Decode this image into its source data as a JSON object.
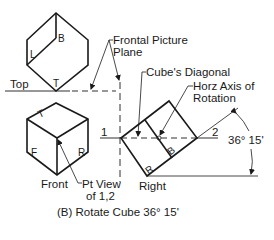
{
  "diagram": {
    "caption": "(B) Rotate Cube 36° 15'",
    "views": {
      "top": {
        "label": "Top",
        "faces": [
          "B",
          "L",
          "T"
        ]
      },
      "front": {
        "label": "Front",
        "faces": [
          "T",
          "F",
          "R"
        ]
      },
      "right": {
        "label": "Right",
        "faces": [
          "R",
          "B"
        ]
      }
    },
    "callouts": {
      "frontal_picture_plane_line1": "Frontal Picture",
      "frontal_picture_plane_line2": "Plane",
      "cubes_diagonal": "Cube's Diagonal",
      "horz_axis_line1": "Horz Axis of",
      "horz_axis_line2": "Rotation",
      "pt_view_line1": "Pt View",
      "pt_view_line2": "of 1,2"
    },
    "points": {
      "p1": "1",
      "p2": "2"
    },
    "angle": "36° 15'",
    "line_color": "#1a1a1a"
  }
}
